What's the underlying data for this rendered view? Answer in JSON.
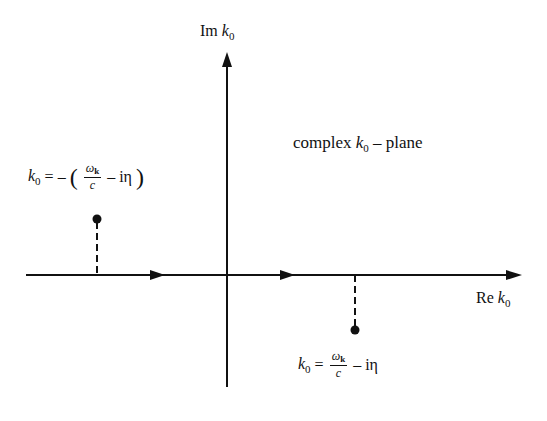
{
  "diagram": {
    "axes": {
      "imaginary": {
        "label_prefix": "Im",
        "label_var": "k",
        "label_sub": "0"
      },
      "real": {
        "label_prefix": "Re",
        "label_var": "k",
        "label_sub": "0"
      }
    },
    "plane_label": {
      "prefix": "complex",
      "var": "k",
      "sub": "0",
      "suffix": "– plane"
    },
    "poles": [
      {
        "position": "upper-left",
        "lhs_var": "k",
        "lhs_sub": "0",
        "eq": "= –",
        "open_paren": "(",
        "frac_num": "ω",
        "frac_num_sub": "k",
        "frac_den": "c",
        "rest": "– iη",
        "close_paren": ")"
      },
      {
        "position": "lower-right",
        "lhs_var": "k",
        "lhs_sub": "0",
        "eq": "=",
        "frac_num": "ω",
        "frac_num_sub": "k",
        "frac_den": "c",
        "rest": "– iη"
      }
    ],
    "colors": {
      "stroke": "#111111",
      "background": "#ffffff"
    }
  }
}
